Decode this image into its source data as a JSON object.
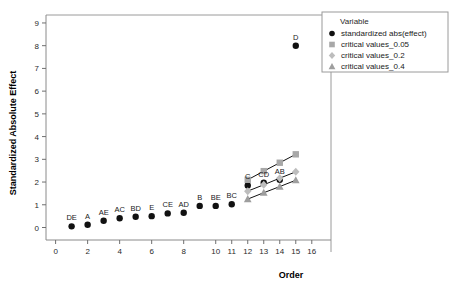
{
  "chart_data": {
    "type": "scatter",
    "title": "",
    "xlabel": "Order",
    "ylabel": "Standardized Absolute Effect",
    "xlim": [
      -0.6,
      17.2
    ],
    "ylim": [
      -0.55,
      9.35
    ],
    "grid": false,
    "x_ticks": [
      0,
      2,
      4,
      6,
      8,
      10,
      11,
      12,
      13,
      14,
      15,
      16
    ],
    "y_ticks": [
      0,
      1,
      2,
      3,
      4,
      5,
      6,
      7,
      8,
      9
    ],
    "legend": {
      "position": "right-top",
      "title": "Variable",
      "entries": [
        {
          "label": "standardized abs(effect)",
          "marker": "circle",
          "color": "#111111"
        },
        {
          "label": "critical values_0.05",
          "marker": "square",
          "color": "#a8a8a8"
        },
        {
          "label": "critical values_0.2",
          "marker": "diamond",
          "color": "#bdbdbd"
        },
        {
          "label": "critical values_0.4",
          "marker": "triangle",
          "color": "#9e9e9e"
        }
      ]
    },
    "series": [
      {
        "name": "standardized abs(effect)",
        "marker": "circle",
        "color": "#111111",
        "x": [
          1,
          2,
          3,
          4,
          5,
          6,
          7,
          8,
          9,
          10,
          11,
          12,
          13,
          14,
          15
        ],
        "values": [
          0.05,
          0.12,
          0.3,
          0.41,
          0.47,
          0.5,
          0.62,
          0.65,
          0.95,
          0.95,
          1.02,
          1.85,
          1.97,
          2.1,
          8.0
        ],
        "point_labels": [
          "DE",
          "A",
          "AE",
          "AC",
          "BD",
          "E",
          "CE",
          "AD",
          "B",
          "BE",
          "BC",
          "C",
          "CD",
          "AB",
          "D"
        ]
      },
      {
        "name": "critical values_0.05",
        "marker": "square",
        "color": "#a8a8a8",
        "x": [
          12,
          13,
          14,
          15
        ],
        "values": [
          2.1,
          2.48,
          2.85,
          3.22
        ]
      },
      {
        "name": "critical values_0.2",
        "marker": "diamond",
        "color": "#bdbdbd",
        "x": [
          12,
          13,
          14,
          15
        ],
        "values": [
          1.6,
          1.88,
          2.17,
          2.45
        ]
      },
      {
        "name": "critical values_0.4",
        "marker": "triangle",
        "color": "#9e9e9e",
        "x": [
          12,
          13,
          14,
          15
        ],
        "values": [
          1.25,
          1.53,
          1.8,
          2.08
        ]
      }
    ]
  }
}
